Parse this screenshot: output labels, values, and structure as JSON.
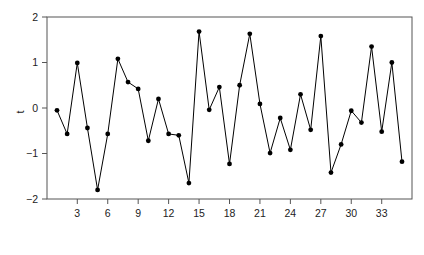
{
  "chart_data": {
    "type": "line",
    "title": "",
    "subtitle": "",
    "xlabel": "",
    "ylabel": "t",
    "xlim": [
      1,
      35
    ],
    "ylim": [
      -2,
      2
    ],
    "grid": false,
    "legend": null,
    "marker": "filled-circle",
    "line_color": "#000000",
    "marker_color": "#000000",
    "x_ticks": [
      3,
      6,
      9,
      12,
      15,
      18,
      21,
      24,
      27,
      30,
      33
    ],
    "x_tick_labels": [
      "3",
      "6",
      "9",
      "12",
      "15",
      "18",
      "21",
      "24",
      "27",
      "30",
      "33"
    ],
    "y_ticks": [
      -2,
      -1,
      0,
      1,
      2
    ],
    "y_tick_labels": [
      "-2",
      "-1",
      "0",
      "1",
      "2"
    ],
    "x": [
      1,
      2,
      3,
      4,
      5,
      6,
      7,
      8,
      9,
      10,
      11,
      12,
      13,
      14,
      15,
      16,
      17,
      18,
      19,
      20,
      21,
      22,
      23,
      24,
      25,
      26,
      27,
      28,
      29,
      30,
      31,
      32,
      33,
      34,
      35
    ],
    "values": [
      -0.05,
      -0.57,
      0.99,
      -0.44,
      -1.8,
      -0.57,
      1.08,
      0.57,
      0.42,
      -0.72,
      0.2,
      -0.57,
      -0.6,
      -1.65,
      1.68,
      -0.04,
      0.46,
      -1.23,
      0.5,
      1.63,
      0.09,
      -0.99,
      -0.22,
      -0.92,
      0.3,
      -0.48,
      1.58,
      -1.42,
      -0.8,
      -0.06,
      -0.32,
      1.35,
      -0.52,
      1.0,
      -1.18
    ],
    "series": [
      {
        "name": "t",
        "values": [
          -0.05,
          -0.57,
          0.99,
          -0.44,
          -1.8,
          -0.57,
          1.08,
          0.57,
          0.42,
          -0.72,
          0.2,
          -0.57,
          -0.6,
          -1.65,
          1.68,
          -0.04,
          0.46,
          -1.23,
          0.5,
          1.63,
          0.09,
          -0.99,
          -0.22,
          -0.92,
          0.3,
          -0.48,
          1.58,
          -1.42,
          -0.8,
          -0.06,
          -0.32,
          1.35,
          -0.52,
          1.0,
          -1.18
        ]
      }
    ]
  },
  "axes": {
    "y_axis_label": "t",
    "frame_color": "#555555",
    "tick_color": "#555555",
    "text_color": "#222222"
  }
}
